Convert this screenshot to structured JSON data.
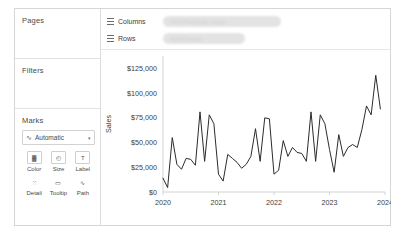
{
  "sidebar": {
    "pages_label": "Pages",
    "filters_label": "Filters",
    "marks_label": "Marks",
    "mark_type": {
      "icon": "line-mark-icon",
      "value": "Automatic",
      "caret": "▾"
    },
    "mark_buttons": [
      {
        "name": "color",
        "label": "Color",
        "icon": "color-palette-icon",
        "glyph": "▓"
      },
      {
        "name": "size",
        "label": "Size",
        "icon": "size-icon",
        "glyph": "◴"
      },
      {
        "name": "label",
        "label": "Label",
        "icon": "label-icon",
        "glyph": "T"
      },
      {
        "name": "detail",
        "label": "Detail",
        "icon": "detail-icon",
        "glyph": "⁙"
      },
      {
        "name": "tooltip",
        "label": "Tooltip",
        "icon": "tooltip-icon",
        "glyph": "▭"
      },
      {
        "name": "path",
        "label": "Path",
        "icon": "path-icon",
        "glyph": "∿"
      }
    ]
  },
  "shelves": [
    {
      "name": "columns",
      "label": "Columns",
      "icon": "grid-icon",
      "pill": "MONTH(Order Date)",
      "blurred": true
    },
    {
      "name": "rows",
      "label": "Rows",
      "icon": "grid-icon",
      "pill": "SUM(Sales)",
      "blurred": true
    }
  ],
  "chart_data": {
    "type": "line",
    "title": "",
    "xlabel": "",
    "ylabel": "Sales",
    "ylim": [
      0,
      137500
    ],
    "yticks": [
      0,
      25000,
      50000,
      75000,
      100000,
      125000
    ],
    "ytick_labels": [
      "$0",
      "$25,000",
      "$50,000",
      "$75,000",
      "$100,000",
      "$125,000"
    ],
    "xticks": [
      "2020",
      "2021",
      "2022",
      "2023",
      "2024"
    ],
    "grid": false,
    "line_color": "#2b2b2b",
    "x": [
      "2020-01",
      "2020-02",
      "2020-03",
      "2020-04",
      "2020-05",
      "2020-06",
      "2020-07",
      "2020-08",
      "2020-09",
      "2020-10",
      "2020-11",
      "2020-12",
      "2021-01",
      "2021-02",
      "2021-03",
      "2021-04",
      "2021-05",
      "2021-06",
      "2021-07",
      "2021-08",
      "2021-09",
      "2021-10",
      "2021-11",
      "2021-12",
      "2022-01",
      "2022-02",
      "2022-03",
      "2022-04",
      "2022-05",
      "2022-06",
      "2022-07",
      "2022-08",
      "2022-09",
      "2022-10",
      "2022-11",
      "2022-12",
      "2023-01",
      "2023-02",
      "2023-03",
      "2023-04",
      "2023-05",
      "2023-06",
      "2023-07",
      "2023-08",
      "2023-09",
      "2023-10",
      "2023-11",
      "2023-12"
    ],
    "values": [
      14000,
      4500,
      55000,
      28000,
      23000,
      34000,
      33000,
      27000,
      81000,
      31000,
      78000,
      69000,
      18000,
      11000,
      38000,
      34000,
      30000,
      24000,
      28000,
      36000,
      64000,
      31000,
      75000,
      74000,
      18000,
      22000,
      52000,
      36000,
      45000,
      40000,
      39000,
      31000,
      81000,
      31000,
      78000,
      69000,
      43000,
      20000,
      58000,
      36000,
      45000,
      48000,
      45000,
      63000,
      87000,
      78000,
      118000,
      84000
    ],
    "series_name": "SUM(Sales)"
  }
}
